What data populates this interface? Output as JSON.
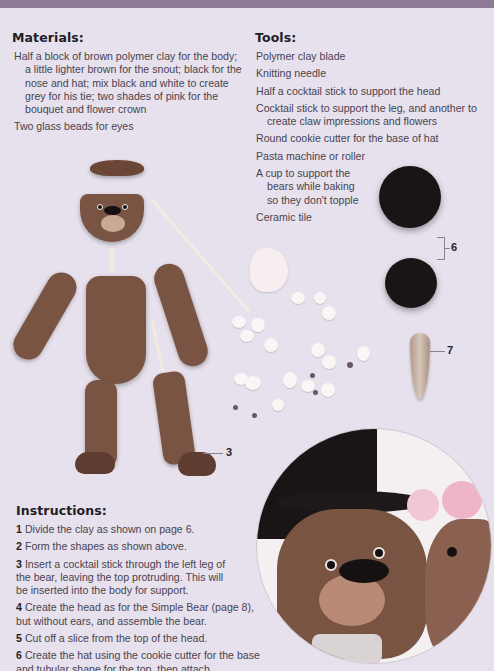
{
  "header_bar": {
    "color": "#8e7b98"
  },
  "materials": {
    "title": "Materials:",
    "items": [
      "Half a block of brown polymer clay for the body; a little lighter brown for the snout; black for the nose and hat; mix black and white to create grey for his tie; two shades of pink for the bouquet and flower crown",
      "Two glass beads for eyes"
    ]
  },
  "tools": {
    "title": "Tools:",
    "items": [
      "Polymer clay blade",
      "Knitting needle",
      "Half a cocktail stick to support the head",
      "Cocktail stick to support the leg, and another to create claw impressions and flowers",
      "Round cookie cutter for the base of hat",
      "Pasta machine or roller",
      "A cup to support the bears while baking so they don't topple",
      "Ceramic tile"
    ]
  },
  "callouts": {
    "leg": "3",
    "hat": "6",
    "flowers": "7"
  },
  "instructions": {
    "title": "Instructions:",
    "steps": [
      {
        "num": "1",
        "text": "Divide the clay as shown on page 6."
      },
      {
        "num": "2",
        "text": "Form the shapes as shown above."
      },
      {
        "num": "3",
        "text": "Insert a cocktail stick through the left leg of the bear, leaving the top protruding. This will be inserted into the body for support."
      },
      {
        "num": "4",
        "text": "Create the head as for the Simple Bear (page 8), but without ears, and assemble the bear."
      },
      {
        "num": "5",
        "text": "Cut off a slice from the top of the head."
      },
      {
        "num": "6",
        "text": "Create the hat using the cookie cutter for the base and tubular shape for the top, then attach."
      }
    ]
  },
  "colors": {
    "background": "#e6e1ec",
    "clay_brown": "#7a5442",
    "hat_black": "#1a1416",
    "flower_pink": "#f2c6d6"
  }
}
